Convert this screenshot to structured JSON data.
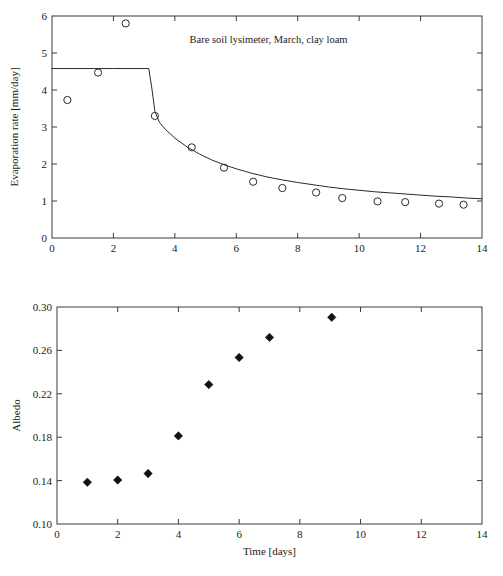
{
  "figure": {
    "width": 503,
    "height": 576,
    "background": "#ffffff",
    "line_color": "#2a2a2a",
    "text_color": "#1a1a1a"
  },
  "chart_data": [
    {
      "id": "evaporation-panel",
      "type": "scatter",
      "title": "Bare soil lysimeter, March, clay loam",
      "xlabel": "",
      "ylabel": "Evaporation rate [mm/day]",
      "xlim": [
        0,
        14
      ],
      "ylim": [
        0,
        6
      ],
      "xticks": [
        0,
        2,
        4,
        6,
        8,
        10,
        12,
        14
      ],
      "xticklabels": [
        "0",
        "2",
        "4",
        "6",
        "8",
        "10",
        "12",
        "14"
      ],
      "yticks": [
        0,
        1,
        2,
        3,
        4,
        5,
        6
      ],
      "yticklabels": [
        "0",
        "1",
        "2",
        "3",
        "4",
        "5",
        "6"
      ],
      "grid": false,
      "legend": "none",
      "series": [
        {
          "name": "Measured evaporation",
          "marker": "open-circle",
          "x": [
            0.5,
            1.5,
            2.4,
            3.35,
            4.55,
            5.6,
            6.55,
            7.5,
            8.6,
            9.45,
            10.6,
            11.5,
            12.6,
            13.4
          ],
          "y": [
            3.73,
            4.47,
            5.8,
            3.3,
            2.45,
            1.9,
            1.52,
            1.35,
            1.23,
            1.08,
            0.99,
            0.97,
            0.93,
            0.9
          ]
        },
        {
          "name": "Model curve",
          "marker": "line",
          "x": [
            0.0,
            1.0,
            2.0,
            3.0,
            3.15,
            3.25,
            3.35,
            3.5,
            3.7,
            4.0,
            4.4,
            4.8,
            5.2,
            5.6,
            6.0,
            6.5,
            7.0,
            7.5,
            8.0,
            8.5,
            9.0,
            9.5,
            10.0,
            10.5,
            11.0,
            11.5,
            12.0,
            12.5,
            13.0,
            13.5,
            14.0
          ],
          "y": [
            4.58,
            4.58,
            4.58,
            4.58,
            4.58,
            4.05,
            3.42,
            3.12,
            2.93,
            2.7,
            2.46,
            2.27,
            2.11,
            1.98,
            1.87,
            1.75,
            1.65,
            1.57,
            1.5,
            1.44,
            1.38,
            1.33,
            1.29,
            1.25,
            1.22,
            1.19,
            1.16,
            1.13,
            1.11,
            1.08,
            1.06
          ]
        }
      ]
    },
    {
      "id": "albedo-panel",
      "type": "scatter",
      "title": "",
      "xlabel": "Time [days]",
      "ylabel": "Albedo",
      "xlim": [
        0,
        14
      ],
      "ylim": [
        0.1,
        0.3
      ],
      "xticks": [
        0,
        2,
        4,
        6,
        8,
        10,
        12,
        14
      ],
      "xticklabels": [
        "0",
        "2",
        "4",
        "6",
        "8",
        "10",
        "12",
        "14"
      ],
      "yticks": [
        0.1,
        0.14,
        0.18,
        0.22,
        0.26,
        0.3
      ],
      "yticklabels": [
        "0.10",
        "0.14",
        "0.18",
        "0.22",
        "0.26",
        "0.30"
      ],
      "grid": false,
      "legend": "none",
      "series": [
        {
          "name": "Measured albedo",
          "marker": "filled-diamond",
          "x": [
            1.0,
            2.0,
            3.0,
            4.0,
            5.0,
            6.0,
            7.0,
            9.05
          ],
          "y": [
            0.1385,
            0.1405,
            0.1465,
            0.1812,
            0.2285,
            0.2535,
            0.272,
            0.2905
          ]
        }
      ]
    }
  ]
}
